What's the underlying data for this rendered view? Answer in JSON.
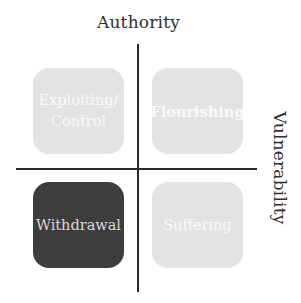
{
  "diagram": {
    "axes": {
      "top_label": "Authority",
      "right_label": "Vulnerability"
    },
    "quadrants": {
      "top_left": {
        "label": "Exploiting/ Control",
        "fill": "#e3e3e3",
        "text_color": "#fafafa",
        "bold": false
      },
      "top_right": {
        "label": "Flourishing",
        "fill": "#e3e3e3",
        "text_color": "#fafafa",
        "bold": true
      },
      "bottom_left": {
        "label": "Withdrawal",
        "fill": "#3d3d3d",
        "text_color": "#d9d9d9",
        "bold": false
      },
      "bottom_right": {
        "label": "Suffering",
        "fill": "#e3e3e3",
        "text_color": "#fafafa",
        "bold": false
      }
    },
    "colors": {
      "axis_line": "#2a2a2a",
      "axis_text": "#2e2e2e",
      "background": "#ffffff"
    }
  }
}
